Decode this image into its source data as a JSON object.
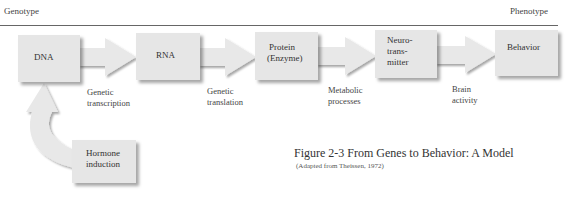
{
  "header": {
    "left": "Genotype",
    "right": "Phenotype"
  },
  "nodes": [
    {
      "id": "dna",
      "label": "DNA"
    },
    {
      "id": "rna",
      "label": "RNA"
    },
    {
      "id": "protein",
      "label_lines": [
        "Protein",
        "(Enzyme)"
      ]
    },
    {
      "id": "neuro",
      "label_lines": [
        "Neuro-",
        "trans-",
        "mitter"
      ]
    },
    {
      "id": "behavior",
      "label": "Behavior"
    },
    {
      "id": "hormone",
      "label_lines": [
        "Hormone",
        "induction"
      ]
    }
  ],
  "edges": [
    {
      "from": "dna",
      "to": "rna",
      "label_lines": [
        "Genetic",
        "transcription"
      ]
    },
    {
      "from": "rna",
      "to": "protein",
      "label_lines": [
        "Genetic",
        "translation"
      ]
    },
    {
      "from": "protein",
      "to": "neuro",
      "label_lines": [
        "Metabolic",
        "processes"
      ]
    },
    {
      "from": "neuro",
      "to": "behavior",
      "label_lines": [
        "Brain",
        "activity"
      ]
    },
    {
      "from": "hormone",
      "to": "dna",
      "label_lines": []
    }
  ],
  "caption": {
    "title": "Figure 2-3 From Genes to Behavior: A Model",
    "source": "(Adapted from Theissen, 1972)"
  },
  "colors": {
    "box": "#e6e6e6",
    "arrow": "#e8e8e8",
    "rule": "#666666"
  }
}
